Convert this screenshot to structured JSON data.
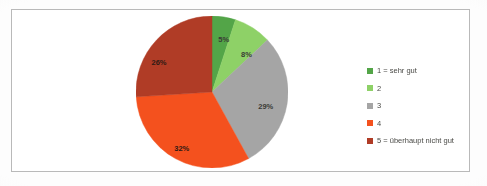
{
  "figure": {
    "border_color": "#b9b9b9",
    "background_color": "#ffffff"
  },
  "chart_data": {
    "type": "pie",
    "title": "",
    "subtitle": "",
    "xlabel": "",
    "ylabel": "",
    "grid": false,
    "legend_position": "right",
    "start_angle_deg": 0,
    "direction": "clockwise",
    "categories": [
      "1 = sehr gut",
      "2",
      "3",
      "4",
      "5 = überhaupt nicht gut"
    ],
    "values": [
      5,
      8,
      29,
      32,
      26
    ],
    "value_unit": "%",
    "data_labels": [
      "5%",
      "8%",
      "29%",
      "32%",
      "26%"
    ],
    "colors": [
      "#53a548",
      "#8ed167",
      "#a5a5a5",
      "#f4511e",
      "#b03c26"
    ],
    "slices": [
      {
        "label": "1 = sehr gut",
        "value": 5,
        "data_label": "5%",
        "color": "#53a548",
        "label_x_pct": 57,
        "label_y_pct": 17,
        "label_tone": "on-light"
      },
      {
        "label": "2",
        "value": 8,
        "data_label": "8%",
        "color": "#8ed167",
        "label_x_pct": 70,
        "label_y_pct": 26,
        "label_tone": "on-light"
      },
      {
        "label": "3",
        "value": 29,
        "data_label": "29%",
        "color": "#a5a5a5",
        "label_x_pct": 81,
        "label_y_pct": 59,
        "label_tone": "on-light"
      },
      {
        "label": "4",
        "value": 32,
        "data_label": "32%",
        "color": "#f4511e",
        "label_x_pct": 33,
        "label_y_pct": 85,
        "label_tone": "on-dark"
      },
      {
        "label": "5 = überhaupt nicht gut",
        "value": 26,
        "data_label": "26%",
        "color": "#b03c26",
        "label_x_pct": 20,
        "label_y_pct": 31,
        "label_tone": "on-dark"
      }
    ]
  },
  "legend": {
    "items": [
      {
        "label": "1 = sehr gut",
        "color": "#53a548"
      },
      {
        "label": "2",
        "color": "#8ed167"
      },
      {
        "label": "3",
        "color": "#a5a5a5"
      },
      {
        "label": "4",
        "color": "#f4511e"
      },
      {
        "label": "5 = überhaupt nicht gut",
        "color": "#b03c26"
      }
    ]
  }
}
